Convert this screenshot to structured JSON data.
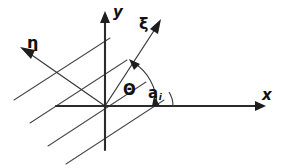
{
  "figure": {
    "kind": "coordinate-axes-diagram",
    "background_color": "#ffffff",
    "ink_color": "#1e1e1e",
    "width": 284,
    "height": 168
  },
  "labels": {
    "x_axis": "x",
    "y_axis": "y",
    "xi_axis": "ξ",
    "eta_axis": "η",
    "theta_angle": "Θ",
    "alpha_angle": "a",
    "alpha_subscript": "i"
  },
  "geometry": {
    "origin": {
      "x": 105,
      "y": 106
    },
    "x_axis": {
      "x1": 56,
      "y1": 106,
      "x2": 266,
      "y2": 106,
      "arrow": "right"
    },
    "y_axis": {
      "x1": 105,
      "y1": 150,
      "x2": 105,
      "y2": 12,
      "arrow": "up"
    },
    "xi_axis": {
      "x1": 105,
      "y1": 106,
      "x2": 160,
      "y2": 21,
      "arrow": "up-right",
      "angle_deg": 57
    },
    "eta_axis": {
      "x1": 105,
      "y1": 106,
      "x2": 22,
      "y2": 48,
      "arrow": "up-left",
      "angle_deg": 145
    },
    "parallel_lines_angle_deg": 33,
    "parallel_lines": [
      {
        "x1": 30,
        "y1": 123,
        "x2": 127,
        "y2": 60
      },
      {
        "x1": 48,
        "y1": 146,
        "x2": 146,
        "y2": 82
      },
      {
        "x1": 66,
        "y1": 163,
        "x2": 163,
        "y2": 100
      },
      {
        "x1": 14,
        "y1": 100,
        "x2": 110,
        "y2": 38
      }
    ],
    "theta_arc": {
      "cx": 105,
      "cy": 106,
      "radius": 52,
      "start_deg": 0,
      "end_deg": 57
    },
    "alpha_arc": {
      "cx": 147,
      "cy": 106,
      "radius": 26,
      "start_deg": 0,
      "end_deg": 33
    }
  },
  "label_positions": {
    "x_axis": {
      "left": 262,
      "top": 88
    },
    "y_axis": {
      "left": 113,
      "top": 6
    },
    "xi_axis": {
      "left": 141,
      "top": 18
    },
    "eta_axis": {
      "left": 27,
      "top": 37
    },
    "theta_angle": {
      "left": 122,
      "top": 83
    },
    "alpha_angle": {
      "left": 147,
      "top": 85
    }
  }
}
